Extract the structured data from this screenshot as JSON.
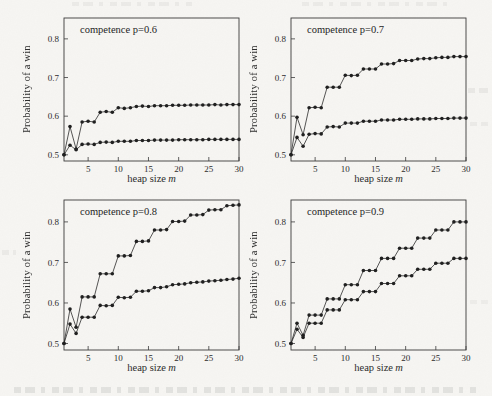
{
  "page": {
    "background": "#f7f6f3",
    "ink_color": "#1f1f1f",
    "description_visible_text_only": true
  },
  "chart_data": [
    {
      "type": "line",
      "title": "competence p=0.6",
      "xlabel": "heap size",
      "xlabel_var": "m",
      "ylabel": "Probability of a win",
      "xlim": [
        1,
        30
      ],
      "ylim": [
        0.484,
        0.854
      ],
      "xticks": [
        5,
        10,
        15,
        20,
        25,
        30
      ],
      "yticks": [
        0.5,
        0.6,
        0.7,
        0.8
      ],
      "grid": false,
      "legend": "none",
      "marker": "filled-circle",
      "color": "#1f1f1f",
      "x": [
        1,
        2,
        3,
        4,
        5,
        6,
        7,
        8,
        9,
        10,
        11,
        12,
        13,
        14,
        15,
        16,
        17,
        18,
        19,
        20,
        21,
        22,
        23,
        24,
        25,
        26,
        27,
        28,
        29,
        30
      ],
      "series": [
        {
          "name": "upper-curve",
          "values": [
            0.5,
            0.573,
            0.515,
            0.585,
            0.587,
            0.585,
            0.61,
            0.612,
            0.61,
            0.622,
            0.62,
            0.622,
            0.625,
            0.626,
            0.625,
            0.627,
            0.627,
            0.627,
            0.628,
            0.628,
            0.628,
            0.629,
            0.629,
            0.629,
            0.629,
            0.63,
            0.629,
            0.63,
            0.63,
            0.63
          ]
        },
        {
          "name": "lower-curve",
          "values": [
            0.5,
            0.525,
            0.513,
            0.527,
            0.528,
            0.527,
            0.532,
            0.533,
            0.532,
            0.535,
            0.535,
            0.535,
            0.537,
            0.537,
            0.537,
            0.538,
            0.538,
            0.538,
            0.538,
            0.539,
            0.539,
            0.539,
            0.539,
            0.539,
            0.54,
            0.54,
            0.54,
            0.54,
            0.54,
            0.54
          ]
        }
      ]
    },
    {
      "type": "line",
      "title": "competence p=0.7",
      "xlabel": "heap size",
      "xlabel_var": "m",
      "ylabel": "Probability of a win",
      "xlim": [
        1,
        30
      ],
      "ylim": [
        0.484,
        0.854
      ],
      "xticks": [
        5,
        10,
        15,
        20,
        25,
        30
      ],
      "yticks": [
        0.5,
        0.6,
        0.7,
        0.8
      ],
      "grid": false,
      "legend": "none",
      "marker": "filled-circle",
      "color": "#1f1f1f",
      "x": [
        1,
        2,
        3,
        4,
        5,
        6,
        7,
        8,
        9,
        10,
        11,
        12,
        13,
        14,
        15,
        16,
        17,
        18,
        19,
        20,
        21,
        22,
        23,
        24,
        25,
        26,
        27,
        28,
        29,
        30
      ],
      "series": [
        {
          "name": "upper-curve",
          "values": [
            0.5,
            0.597,
            0.552,
            0.622,
            0.623,
            0.622,
            0.675,
            0.675,
            0.675,
            0.706,
            0.705,
            0.706,
            0.722,
            0.722,
            0.722,
            0.735,
            0.735,
            0.736,
            0.744,
            0.744,
            0.744,
            0.748,
            0.749,
            0.749,
            0.751,
            0.752,
            0.752,
            0.754,
            0.754,
            0.754
          ]
        },
        {
          "name": "lower-curve",
          "values": [
            0.5,
            0.545,
            0.522,
            0.553,
            0.555,
            0.554,
            0.572,
            0.573,
            0.572,
            0.582,
            0.582,
            0.582,
            0.587,
            0.587,
            0.587,
            0.59,
            0.59,
            0.59,
            0.592,
            0.592,
            0.592,
            0.593,
            0.593,
            0.593,
            0.594,
            0.594,
            0.594,
            0.595,
            0.595,
            0.595
          ]
        }
      ]
    },
    {
      "type": "line",
      "title": "competence p=0.8",
      "xlabel": "heap size",
      "xlabel_var": "m",
      "ylabel": "Probability of a win",
      "xlim": [
        1,
        30
      ],
      "ylim": [
        0.484,
        0.854
      ],
      "xticks": [
        5,
        10,
        15,
        20,
        25,
        30
      ],
      "yticks": [
        0.5,
        0.6,
        0.7,
        0.8
      ],
      "grid": false,
      "legend": "none",
      "marker": "filled-circle",
      "color": "#1f1f1f",
      "x": [
        1,
        2,
        3,
        4,
        5,
        6,
        7,
        8,
        9,
        10,
        11,
        12,
        13,
        14,
        15,
        16,
        17,
        18,
        19,
        20,
        21,
        22,
        23,
        24,
        25,
        26,
        27,
        28,
        29,
        30
      ],
      "series": [
        {
          "name": "upper-curve",
          "values": [
            0.5,
            0.585,
            0.54,
            0.615,
            0.615,
            0.615,
            0.672,
            0.672,
            0.672,
            0.716,
            0.716,
            0.717,
            0.752,
            0.752,
            0.753,
            0.78,
            0.78,
            0.781,
            0.801,
            0.801,
            0.802,
            0.817,
            0.817,
            0.818,
            0.829,
            0.83,
            0.83,
            0.84,
            0.841,
            0.842
          ]
        },
        {
          "name": "lower-curve",
          "values": [
            0.5,
            0.548,
            0.525,
            0.565,
            0.565,
            0.565,
            0.594,
            0.593,
            0.594,
            0.614,
            0.613,
            0.614,
            0.629,
            0.629,
            0.63,
            0.638,
            0.638,
            0.64,
            0.645,
            0.646,
            0.647,
            0.65,
            0.651,
            0.652,
            0.654,
            0.655,
            0.656,
            0.658,
            0.659,
            0.661
          ]
        }
      ]
    },
    {
      "type": "line",
      "title": "competence p=0.9",
      "xlabel": "heap size",
      "xlabel_var": "m",
      "ylabel": "Probability of a win",
      "xlim": [
        1,
        30
      ],
      "ylim": [
        0.484,
        0.854
      ],
      "xticks": [
        5,
        10,
        15,
        20,
        25,
        30
      ],
      "yticks": [
        0.5,
        0.6,
        0.7,
        0.8
      ],
      "grid": false,
      "legend": "none",
      "marker": "filled-circle",
      "color": "#1f1f1f",
      "x": [
        1,
        2,
        3,
        4,
        5,
        6,
        7,
        8,
        9,
        10,
        11,
        12,
        13,
        14,
        15,
        16,
        17,
        18,
        19,
        20,
        21,
        22,
        23,
        24,
        25,
        26,
        27,
        28,
        29,
        30
      ],
      "series": [
        {
          "name": "upper-curve",
          "values": [
            0.5,
            0.55,
            0.52,
            0.57,
            0.57,
            0.57,
            0.61,
            0.61,
            0.61,
            0.645,
            0.645,
            0.645,
            0.68,
            0.68,
            0.68,
            0.71,
            0.71,
            0.71,
            0.735,
            0.735,
            0.735,
            0.76,
            0.76,
            0.76,
            0.78,
            0.78,
            0.78,
            0.8,
            0.8,
            0.8
          ]
        },
        {
          "name": "lower-curve",
          "values": [
            0.5,
            0.535,
            0.515,
            0.55,
            0.55,
            0.55,
            0.583,
            0.583,
            0.583,
            0.608,
            0.608,
            0.608,
            0.628,
            0.628,
            0.628,
            0.648,
            0.648,
            0.648,
            0.667,
            0.667,
            0.667,
            0.683,
            0.683,
            0.683,
            0.698,
            0.698,
            0.698,
            0.71,
            0.71,
            0.71
          ]
        }
      ]
    }
  ]
}
